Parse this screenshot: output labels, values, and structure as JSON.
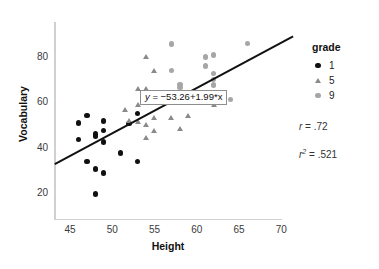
{
  "chart_data": {
    "type": "scatter",
    "title": "",
    "xlabel": "Height",
    "ylabel": "Vocabulary",
    "xlim": [
      43.2,
      71.5
    ],
    "ylim": [
      14,
      90
    ],
    "xticks": [
      "45",
      "50",
      "55",
      "60",
      "65",
      "70"
    ],
    "yticks": [
      "20",
      "40",
      "60",
      "80"
    ],
    "grid": false,
    "legend": {
      "title": "grade",
      "position": "right",
      "entries": [
        {
          "label": "1",
          "marker": "circle",
          "color": "#111111"
        },
        {
          "label": "5",
          "marker": "triangle",
          "color": "#8a8a8a"
        },
        {
          "label": "9",
          "marker": "circle",
          "color": "#a6a6a6"
        }
      ]
    },
    "annotations": {
      "equation": "y = −53.26+1.99*x",
      "equation_y": "y",
      "equation_rest": " = −53.26+1.99*x",
      "r_label": "r",
      "r_value": " = .72",
      "r2_label": "r",
      "r2_exp": "2",
      "r2_value": " = .521"
    },
    "fit_line": {
      "intercept": -53.26,
      "slope": 1.99,
      "x_start": 43.2,
      "x_end": 71.4,
      "color": "#111111"
    },
    "series": [
      {
        "name": "1",
        "marker": "circle",
        "color": "#111111",
        "points": [
          [
            46.0,
            50.8
          ],
          [
            46.0,
            43.4
          ],
          [
            47.0,
            54.0
          ],
          [
            47.0,
            33.9
          ],
          [
            48.0,
            45.9
          ],
          [
            48.0,
            45.1
          ],
          [
            48.0,
            30.6
          ],
          [
            48.0,
            19.5
          ],
          [
            49.0,
            51.7
          ],
          [
            49.0,
            47.6
          ],
          [
            49.0,
            42.4
          ],
          [
            49.0,
            28.8
          ],
          [
            51.0,
            37.6
          ],
          [
            52.0,
            50.6
          ],
          [
            53.0,
            55.0
          ],
          [
            53.0,
            33.8
          ]
        ]
      },
      {
        "name": "5",
        "marker": "triangle",
        "color": "#8a8a8a",
        "points": [
          [
            53.0,
            66.0
          ],
          [
            53.0,
            59.0
          ],
          [
            53.0,
            51.5
          ],
          [
            54.0,
            79.8
          ],
          [
            54.0,
            66.0
          ],
          [
            54.0,
            50.0
          ],
          [
            54.0,
            44.2
          ],
          [
            55.0,
            74.0
          ],
          [
            55.0,
            53.0
          ],
          [
            55.0,
            47.5
          ],
          [
            57.0,
            53.0
          ],
          [
            58.0,
            48.5
          ],
          [
            59.0,
            54.2
          ],
          [
            62.0,
            58.8
          ],
          [
            52.0,
            52.0
          ],
          [
            51.5,
            56.5
          ]
        ]
      },
      {
        "name": "9",
        "marker": "circle",
        "color": "#a6a6a6",
        "points": [
          [
            57.0,
            85.5
          ],
          [
            57.0,
            73.8
          ],
          [
            58.0,
            67.8
          ],
          [
            58.0,
            66.5
          ],
          [
            60.0,
            64.3
          ],
          [
            61.0,
            79.8
          ],
          [
            61.0,
            75.8
          ],
          [
            62.0,
            80.6
          ],
          [
            62.0,
            72.5
          ],
          [
            62.0,
            70.0
          ],
          [
            62.0,
            67.5
          ],
          [
            62.0,
            63.0
          ],
          [
            63.0,
            62.8
          ],
          [
            64.0,
            61.0
          ],
          [
            66.0,
            85.6
          ],
          [
            59.5,
            61.0
          ]
        ]
      }
    ]
  }
}
